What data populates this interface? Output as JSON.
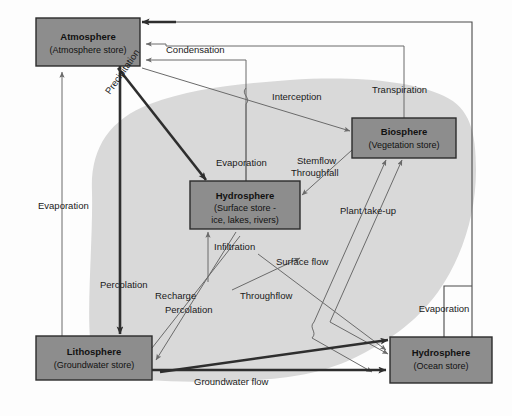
{
  "diagram": {
    "colors": {
      "store_fill": "#8d8d8d",
      "store_stroke": "#2b2b2b",
      "drainage_basin_fill": "#d9d9d9",
      "background": "#fdfdfd",
      "thick_flow": "#2e2e2e",
      "thin_flow": "#6a6a6a"
    },
    "stores": [
      {
        "id": "atmosphere",
        "title": "Atmosphere",
        "subtitle": "(Atmosphere store)",
        "x": 36,
        "y": 18,
        "w": 104,
        "h": 48
      },
      {
        "id": "hydrosphere-surface",
        "title": "Hydrosphere",
        "subtitle_lines": [
          "(Surface store -",
          "ice, lakes, rivers)"
        ],
        "subtitle": "(Surface store - ice, lakes, rivers)",
        "x": 190,
        "y": 181,
        "w": 110,
        "h": 48
      },
      {
        "id": "biosphere",
        "title": "Biosphere",
        "subtitle": "(Vegetation store)",
        "x": 352,
        "y": 118,
        "w": 104,
        "h": 40
      },
      {
        "id": "lithosphere",
        "title": "Lithosphere",
        "subtitle": "(Groundwater store)",
        "x": 36,
        "y": 336,
        "w": 116,
        "h": 44
      },
      {
        "id": "hydrosphere-ocean",
        "title": "Hydrosphere",
        "subtitle": "(Ocean store)",
        "x": 390,
        "y": 337,
        "w": 102,
        "h": 46
      }
    ],
    "flows": [
      {
        "id": "condensation",
        "label": "Condensation",
        "x": 166,
        "y": 53,
        "rotate": 0
      },
      {
        "id": "precipitation",
        "label": "Precipitation",
        "x": 110,
        "y": 95,
        "rotate": -55
      },
      {
        "id": "interception",
        "label": "Interception",
        "x": 272,
        "y": 100,
        "rotate": 0
      },
      {
        "id": "transpiration",
        "label": "Transpiration",
        "x": 372,
        "y": 93,
        "rotate": 0
      },
      {
        "id": "evaporation-atmosphere",
        "label": "Evaporation",
        "x": 38,
        "y": 209,
        "rotate": 0
      },
      {
        "id": "evaporation-surface",
        "label": "Evaporation",
        "x": 216,
        "y": 166,
        "rotate": 0
      },
      {
        "id": "stemflow",
        "label": "Stemflow",
        "x": 297,
        "y": 164,
        "rotate": 0
      },
      {
        "id": "throughfall",
        "label": "Throughfall",
        "x": 294,
        "y": 176,
        "rotate": 0
      },
      {
        "id": "plant-take-up",
        "label": "Plant take-up",
        "x": 340,
        "y": 214,
        "rotate": 0
      },
      {
        "id": "infiltration",
        "label": "Infiltration",
        "x": 214,
        "y": 250,
        "rotate": 0
      },
      {
        "id": "surface-flow",
        "label": "Surface flow",
        "x": 276,
        "y": 265,
        "rotate": 0
      },
      {
        "id": "percolation-1",
        "label": "Percolation",
        "x": 100,
        "y": 288,
        "rotate": 0
      },
      {
        "id": "recharge",
        "label": "Recharge",
        "x": 155,
        "y": 299,
        "rotate": 0
      },
      {
        "id": "percolation-2",
        "label": "Percolation",
        "x": 165,
        "y": 313,
        "rotate": 0
      },
      {
        "id": "throughflow",
        "label": "Throughflow",
        "x": 240,
        "y": 299,
        "rotate": 0
      },
      {
        "id": "groundwater-flow",
        "label": "Groundwater flow",
        "x": 194,
        "y": 385,
        "rotate": 0
      },
      {
        "id": "evaporation-ocean",
        "label": "Evaporation",
        "x": 444,
        "y": 312,
        "rotate": 0
      }
    ]
  }
}
